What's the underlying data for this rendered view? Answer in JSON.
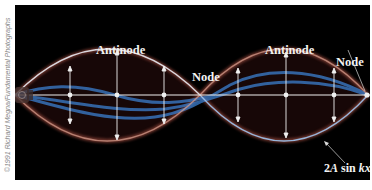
{
  "figure": {
    "credit": "©1991 Richard Megna/Fundamental Photographs",
    "labels": {
      "antinode_left": "Antinode",
      "antinode_right": "Antinode",
      "node_middle": "Node",
      "node_right": "Node",
      "envelope_prefix": "2",
      "envelope_A": "A",
      "envelope_sin": " sin ",
      "envelope_kx": "kx"
    },
    "colors": {
      "background": "#000000",
      "envelope_white": "#e8ecf4",
      "reddish_glow": "#c0604a",
      "blue_string": "#3a7fd0",
      "arrows": "#f0f0f0",
      "text": "#f2f2f2"
    },
    "geometry": {
      "axis_y": 90,
      "amplitude": 38,
      "nodes_x": [
        0,
        185,
        353
      ],
      "arrow_x_left_lobe": [
        55,
        102,
        149
      ],
      "arrow_x_right_lobe": [
        223,
        271,
        319
      ]
    }
  }
}
